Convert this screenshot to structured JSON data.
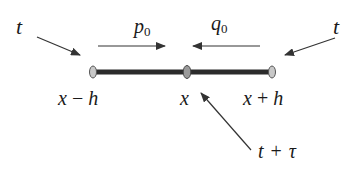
{
  "diagram": {
    "labels": {
      "t_left": "t",
      "t_right": "t",
      "p_var": "p",
      "p_sub": "0",
      "q_var": "q",
      "q_sub": "0",
      "left_point_x": "x",
      "left_point_op": "−",
      "left_point_h": "h",
      "mid_point": "x",
      "right_point_x": "x",
      "right_point_op": "+",
      "right_point_h": "h",
      "bottom_t": "t",
      "bottom_op": "+",
      "bottom_tau": "τ"
    },
    "colors": {
      "bar": "#2b2b2b",
      "node_fill": "#c8c8c8",
      "node_stroke": "#555555",
      "arrow": "#333333",
      "text": "#1a1a1a"
    },
    "nodes": [
      {
        "id": "left",
        "cx": 93,
        "cy": 72
      },
      {
        "id": "middle",
        "cx": 187,
        "cy": 72
      },
      {
        "id": "right",
        "cx": 272,
        "cy": 72
      }
    ]
  }
}
